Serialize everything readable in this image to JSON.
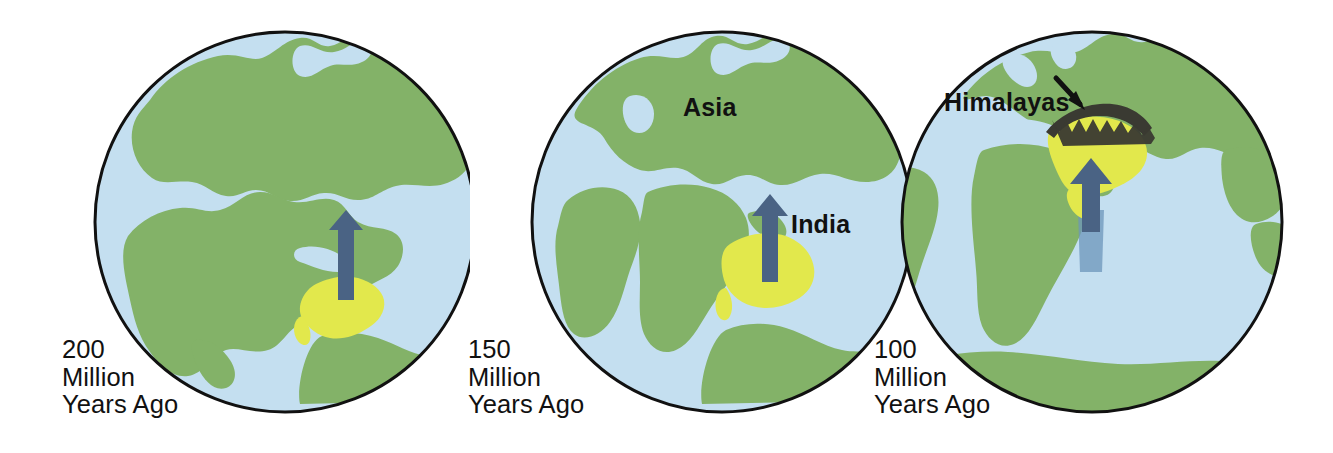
{
  "figure": {
    "background_color": "#ffffff",
    "width": 1333,
    "height": 453
  },
  "palette": {
    "land_green": "#83b268",
    "ocean_blue": "#c4dff0",
    "india_yellow": "#e2e84c",
    "arrow_blue": "#4a6384",
    "outline_black": "#111111",
    "mountain_dark": "#3a3a32",
    "text_black": "#111111"
  },
  "panels": [
    {
      "id": "panel-200",
      "caption": {
        "line1": "200",
        "line2": "Million",
        "line3": "Years Ago"
      },
      "labels": [],
      "features": {
        "landmass": "Pangaea supercontinent",
        "india_plate": "India (yellow)",
        "motion_arrow": "northward arrow",
        "mountains": false
      }
    },
    {
      "id": "panel-150",
      "caption": {
        "line1": "150",
        "line2": "Million",
        "line3": "Years Ago"
      },
      "labels": [
        {
          "name": "asia-label",
          "text": "Asia"
        },
        {
          "name": "india-label",
          "text": "India"
        }
      ],
      "features": {
        "landmass": "Laurasia and Gondwana separating",
        "india_plate": "India (yellow)",
        "motion_arrow": "northward arrow",
        "mountains": false
      }
    },
    {
      "id": "panel-100",
      "caption": {
        "line1": "100",
        "line2": "Million",
        "line3": "Years Ago"
      },
      "labels": [
        {
          "name": "himalayas-label",
          "text": "Himalayas"
        }
      ],
      "features": {
        "landmass": "Modern continent arrangement",
        "india_plate": "India collided with Asia (yellow)",
        "motion_arrow": "northward arrow with trail",
        "mountains": true
      }
    }
  ]
}
